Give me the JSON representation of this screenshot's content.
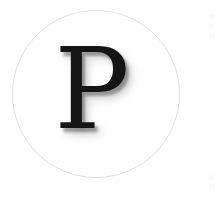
{
  "canvas": {
    "width": 221,
    "height": 199,
    "background_color": "#ffffff"
  },
  "logo": {
    "letter": "P",
    "letter_color": "#151515",
    "circle_border_color": "#e3e3e3",
    "circle_fill_color": "#ffffff",
    "shadow_color": "#808080",
    "alt_text": "P"
  }
}
